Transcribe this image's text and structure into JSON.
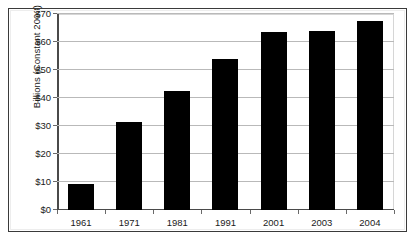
{
  "chart_data": {
    "type": "bar",
    "title": "",
    "subtitle": "",
    "xlabel": "",
    "ylabel": "Billions (Constant 2003)",
    "categories": [
      "1961",
      "1971",
      "1981",
      "1991",
      "2001",
      "2003",
      "2004"
    ],
    "values": [
      9.3,
      31.5,
      42.5,
      54,
      63.5,
      64,
      67.5
    ],
    "ylim": [
      0,
      70
    ],
    "ytick_values": [
      0,
      10,
      20,
      30,
      40,
      50,
      60,
      70
    ],
    "ytick_labels": [
      "$0",
      "$10",
      "$20",
      "$30",
      "$40",
      "$50",
      "$60",
      "$70"
    ],
    "grid": true,
    "grid_axis": "y",
    "legend": false,
    "legend_position": "none",
    "bar_color": "#000000",
    "plot_background": "#ffffff",
    "gridline_color": "#b9b9b9",
    "axis_color": "#4a4a4a",
    "frame_color": "#3a3a3a"
  }
}
